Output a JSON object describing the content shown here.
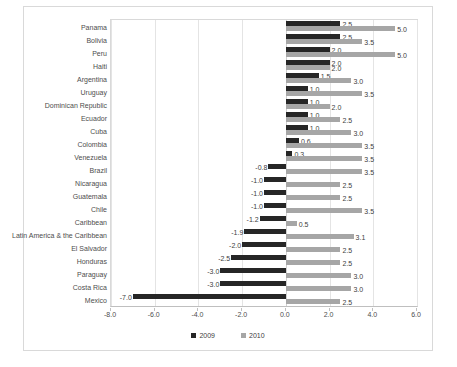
{
  "chart_data": {
    "type": "bar",
    "orientation": "horizontal",
    "title": "",
    "xlabel": "",
    "ylabel": "",
    "xlim": [
      -8.0,
      6.0
    ],
    "xticks": [
      "-8.0",
      "-6.0",
      "-4.0",
      "-2.0",
      "0.0",
      "2.0",
      "4.0",
      "6.0"
    ],
    "xtick_values": [
      -8.0,
      -6.0,
      -4.0,
      -2.0,
      0.0,
      2.0,
      4.0,
      6.0
    ],
    "grid": true,
    "legend_position": "bottom",
    "categories": [
      "Panama",
      "Bolivia",
      "Peru",
      "Haiti",
      "Argentina",
      "Uruguay",
      "Dominican Republic",
      "Ecuador",
      "Cuba",
      "Colombia",
      "Venezuela",
      "Brazil",
      "Nicaragua",
      "Guatemala",
      "Chile",
      "Caribbean",
      "Latin America & the Caribbean",
      "El Salvador",
      "Honduras",
      "Paraguay",
      "Costa Rica",
      "Mexico"
    ],
    "series": [
      {
        "name": "2009",
        "color": "#262626",
        "values": [
          2.5,
          2.5,
          2.0,
          2.0,
          1.5,
          1.0,
          1.0,
          1.0,
          1.0,
          0.6,
          0.3,
          -0.8,
          -1.0,
          -1.0,
          -1.0,
          -1.2,
          -1.9,
          -2.0,
          -2.5,
          -3.0,
          -3.0,
          -7.0
        ],
        "labels": [
          "2.5",
          "2.5",
          "2.0",
          "2.0",
          "1.5",
          "1.0",
          "1.0",
          "1.0",
          "1.0",
          "0.6",
          "0.3",
          "-0.8",
          "-1.0",
          "-1.0",
          "-1.0",
          "-1.2",
          "-1.9",
          "-2.0",
          "-2.5",
          "-3.0",
          "-3.0",
          "-7.0"
        ]
      },
      {
        "name": "2010",
        "color": "#a6a6a6",
        "values": [
          5.0,
          3.5,
          5.0,
          2.0,
          3.0,
          3.5,
          2.0,
          2.5,
          3.0,
          3.5,
          3.5,
          3.5,
          2.5,
          2.5,
          3.5,
          0.5,
          3.1,
          2.5,
          2.5,
          3.0,
          3.0,
          2.5
        ],
        "labels": [
          "5.0",
          "3.5",
          "5.0",
          "2.0",
          "3.0",
          "3.5",
          "2.0",
          "2.5",
          "3.0",
          "3.5",
          "3.5",
          "3.5",
          "2.5",
          "2.5",
          "3.5",
          "0.5",
          "3.1",
          "2.5",
          "2.5",
          "3.0",
          "3.0",
          "2.5"
        ]
      }
    ]
  },
  "legend": {
    "items": [
      {
        "label": "2009",
        "color": "#262626"
      },
      {
        "label": "2010",
        "color": "#a6a6a6"
      }
    ]
  }
}
